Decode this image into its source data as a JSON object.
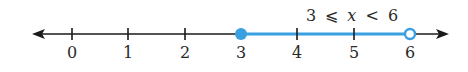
{
  "inequality": {
    "text": "3 ⩽ x < 6",
    "lhs": "3",
    "op1": "⩽",
    "var": "x",
    "op2": "<",
    "rhs": "6"
  },
  "number_line": {
    "ticks": [
      "0",
      "1",
      "2",
      "3",
      "4",
      "5",
      "6"
    ],
    "closed_endpoint": "3",
    "open_endpoint": "6",
    "colors": {
      "axis": "#1a1a1a",
      "highlight": "#3aa0e0"
    }
  }
}
